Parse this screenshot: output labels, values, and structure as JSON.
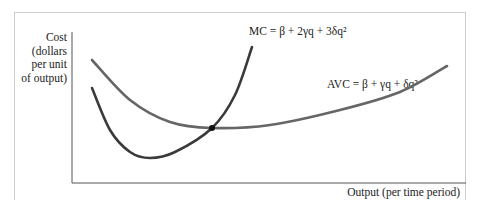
{
  "chart_data": {
    "type": "line",
    "title": "",
    "xlabel": "Output (per time period)",
    "ylabel": "Cost (dollars per unit of output)",
    "ylabel_lines": [
      "Cost",
      "(dollars",
      "per unit",
      "of output)"
    ],
    "grid": false,
    "legend": "inline annotations",
    "axis_ticks": "none",
    "series": [
      {
        "name": "MC",
        "label": "MC = β + 2γq + 3δq²",
        "color": "#3a3a3a",
        "shape": "U-shaped, steeper; minimum below AVC minimum, rises sharply",
        "points_px": [
          [
            92,
            88
          ],
          [
            110,
            130
          ],
          [
            130,
            152
          ],
          [
            150,
            158
          ],
          [
            175,
            152
          ],
          [
            212,
            128
          ],
          [
            235,
            95
          ],
          [
            252,
            47
          ]
        ]
      },
      {
        "name": "AVC",
        "label": "AVC = β + γq + δq²",
        "color": "#666666",
        "shape": "U-shaped, shallower; minimum where MC crosses",
        "points_px": [
          [
            92,
            60
          ],
          [
            130,
            100
          ],
          [
            170,
            122
          ],
          [
            212,
            128
          ],
          [
            270,
            125
          ],
          [
            340,
            110
          ],
          [
            400,
            92
          ],
          [
            447,
            66
          ]
        ]
      }
    ],
    "annotations": [
      {
        "type": "point",
        "description": "MC intersects AVC at AVC minimum",
        "x_px": 212,
        "y_px": 128
      }
    ]
  },
  "labels": {
    "ylabel_text": "Cost\n(dollars\nper unit\nof output)",
    "xlabel_text": "Output (per time period)",
    "mc_text": "MC = β + 2γq + 3δq²",
    "avc_text": "AVC = β + γq + δq²"
  }
}
